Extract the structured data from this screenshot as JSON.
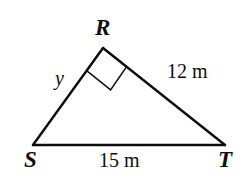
{
  "figure": {
    "kind": "right-triangle-diagram",
    "background_color": "#ffffff",
    "stroke_color": "#0d0d0d",
    "vertices": [
      {
        "id": "R",
        "label": "R",
        "x": 103,
        "y": 48
      },
      {
        "id": "S",
        "label": "S",
        "x": 33,
        "y": 145
      },
      {
        "id": "T",
        "label": "T",
        "x": 225,
        "y": 145
      }
    ],
    "edges": [
      {
        "id": "SR",
        "from": "S",
        "to": "R",
        "label": "y",
        "label_style": "italic"
      },
      {
        "id": "RT",
        "from": "R",
        "to": "T",
        "label": "12 m",
        "label_style": "upright"
      },
      {
        "id": "ST",
        "from": "S",
        "to": "T",
        "label": "15 m",
        "label_style": "upright"
      }
    ],
    "right_angle": {
      "at_vertex": "R",
      "marker": "right-angle-square",
      "size": 30
    },
    "labels": {
      "vertex_R": "R",
      "vertex_S": "S",
      "vertex_T": "T",
      "side_SR": "y",
      "side_RT": "12 m",
      "side_ST": "15 m"
    }
  }
}
